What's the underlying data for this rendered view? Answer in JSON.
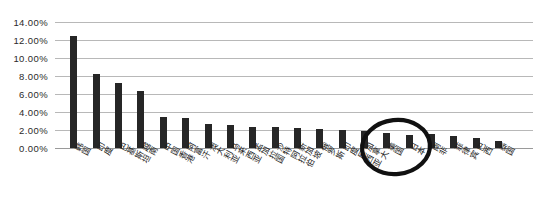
{
  "chart_data": {
    "type": "bar",
    "title": "",
    "subtitle": "",
    "xlabel": "",
    "ylabel": "",
    "ylim": [
      0,
      14
    ],
    "ytick_labels": [
      "0.00%",
      "2.00%",
      "4.00%",
      "6.00%",
      "8.00%",
      "10.00%",
      "12.00%",
      "14.00%"
    ],
    "ytick_values": [
      0,
      2,
      4,
      6,
      8,
      10,
      12,
      14
    ],
    "grid": true,
    "legend": false,
    "bar_color": "#262626",
    "categories": [
      "韩国",
      "印度",
      "巴基斯坦",
      "越南",
      "中国香港",
      "阿富汗",
      "澳大利亚",
      "马来西亚",
      "孟加拉国",
      "沙特阿拉伯",
      "新加坡",
      "俄罗斯",
      "印度尼西亚",
      "加拿大",
      "美国",
      "日本",
      "南非",
      "菲律宾",
      "巴西",
      "泰国"
    ],
    "values": [
      12.5,
      8.2,
      7.2,
      6.3,
      3.4,
      3.3,
      2.7,
      2.6,
      2.3,
      2.3,
      2.2,
      2.1,
      2.0,
      1.9,
      1.7,
      1.5,
      1.6,
      1.3,
      1.1,
      0.8
    ],
    "annotations": [
      {
        "type": "ellipse",
        "name": "japan-highlight-circle",
        "target_category": "日本",
        "color": "#111111"
      }
    ]
  }
}
